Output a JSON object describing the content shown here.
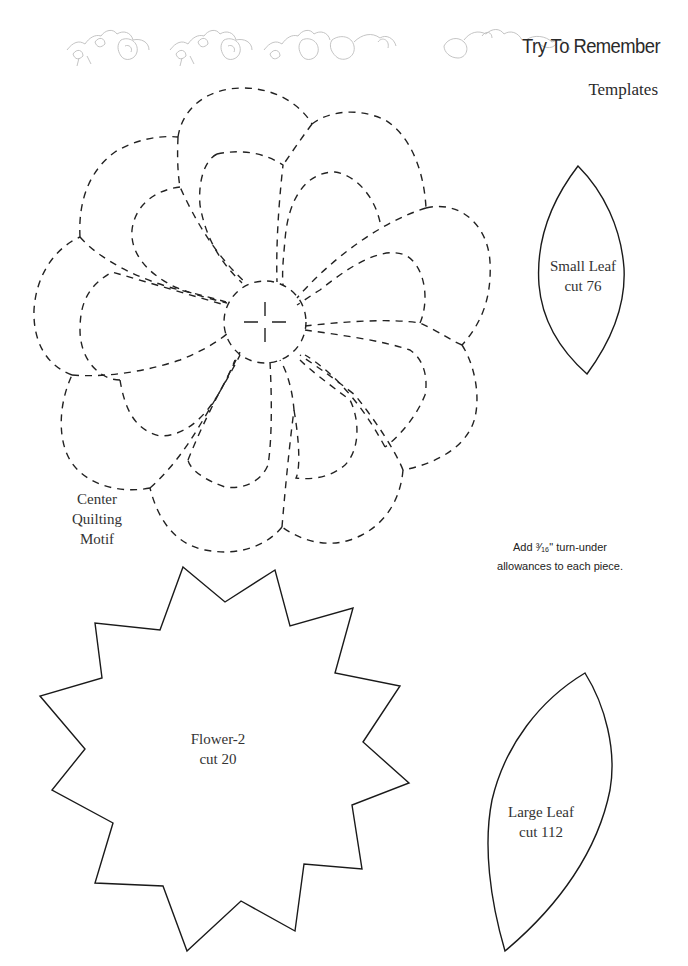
{
  "header": {
    "title": "Try To Remember",
    "subtitle": "Templates",
    "ornament": "floral-vine-border"
  },
  "templates": {
    "center_motif": {
      "label_lines": [
        "Center",
        "Quilting",
        "Motif"
      ],
      "style": "dashed",
      "petals": 9
    },
    "small_leaf": {
      "label_lines": [
        "Small Leaf",
        "cut 76"
      ]
    },
    "flower": {
      "label_lines": [
        "Flower-2",
        "cut 20"
      ],
      "points": 12
    },
    "large_leaf": {
      "label_lines": [
        "Large Leaf",
        "cut 112"
      ]
    }
  },
  "note": {
    "line1": "Add ³⁄₁₆\" turn-under",
    "line2": "allowances to each piece."
  },
  "colors": {
    "ink": "#222222",
    "ornament": "#bdbdbd",
    "background": "#ffffff"
  }
}
